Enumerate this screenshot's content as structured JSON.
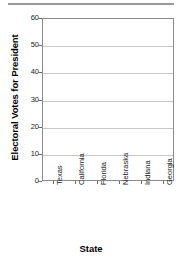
{
  "decor": {
    "top_rule": "horizontal-rule"
  },
  "chart_data": {
    "type": "bar",
    "title": "",
    "subtitle": "",
    "xlabel": "State",
    "ylabel": "Electoral Votes for President",
    "categories": [
      "Texas",
      "California",
      "Florida",
      "Nebraska",
      "Indiana",
      "Georgia"
    ],
    "values": [
      null,
      null,
      null,
      null,
      null,
      null
    ],
    "values_note": "no bars plotted — blank chart template",
    "ylim": [
      0,
      60
    ],
    "ytick_values": [
      60,
      50,
      40,
      30,
      20,
      10,
      0
    ],
    "ytick_labels": [
      "60",
      "50",
      "40",
      "30",
      "20",
      "10",
      "0"
    ],
    "ytick_step": 10,
    "grid": "horizontal",
    "legend": "none",
    "xtick_label_rotation": -90,
    "colors": {
      "plot_background": "#ffffff",
      "figure_background": "#ffffff",
      "axis_line": "#8a8a8a",
      "gridline": "#c8c8c8",
      "tick_mark": "#6a6a6a",
      "tick_label_text": "#1a1a1a",
      "axis_title_text": "#000000",
      "top_rule": "#9a9a9a"
    }
  }
}
